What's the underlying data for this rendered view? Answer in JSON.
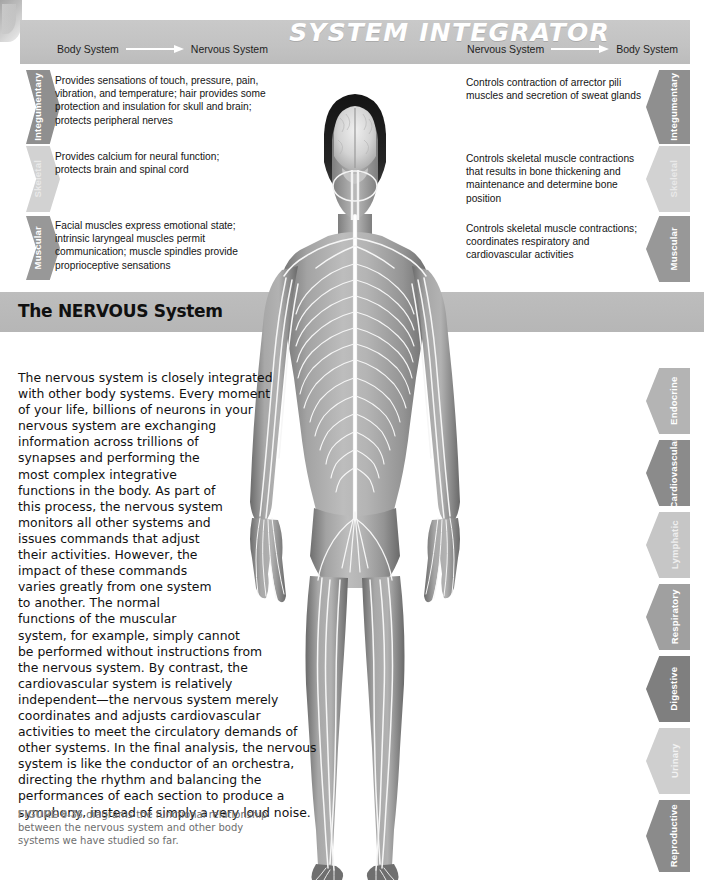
{
  "header": {
    "title": "SYSTEM INTEGRATOR",
    "flow_left": {
      "from": "Body System",
      "to": "Nervous System"
    },
    "flow_right": {
      "from": "Nervous System",
      "to": "Body System"
    }
  },
  "banner": {
    "title": "The NERVOUS System"
  },
  "left_column": [
    {
      "system": "Integumentary",
      "text": "Provides sensations of touch, pressure, pain, vibration, and temperature; hair provides some protection and insulation for skull and brain; protects peripheral nerves",
      "color": "#8f8f8f"
    },
    {
      "system": "Skeletal",
      "text": "Provides calcium for neural function; protects brain and spinal cord",
      "color": "#d2d2d2"
    },
    {
      "system": "Muscular",
      "text": "Facial muscles express emotional state; intrinsic laryngeal muscles permit communication; muscle spindles provide proprioceptive sensations",
      "color": "#989898"
    }
  ],
  "right_column": [
    {
      "system": "Integumentary",
      "text": "Controls contraction of arrector pili muscles and secretion of sweat glands",
      "color": "#8f8f8f"
    },
    {
      "system": "Skeletal",
      "text": "Controls skeletal muscle contractions that results in bone thickening and maintenance and determine bone position",
      "color": "#d2d2d2"
    },
    {
      "system": "Muscular",
      "text": "Controls skeletal muscle contractions; coordinates respiratory and  cardiovascular activities",
      "color": "#989898"
    }
  ],
  "system_tabs": [
    {
      "system": "Endocrine",
      "color": "#b4b4b4"
    },
    {
      "system": "Cardiovascular",
      "color": "#8b8b8b"
    },
    {
      "system": "Lymphatic",
      "color": "#c6c6c6"
    },
    {
      "system": "Respiratory",
      "color": "#a0a0a0"
    },
    {
      "system": "Digestive",
      "color": "#7f7f7f"
    },
    {
      "system": "Urinary",
      "color": "#cfcfcf"
    },
    {
      "system": "Reproductive",
      "color": "#8b8b8b"
    }
  ],
  "body_copy_lines": [
    "The nervous system is closely integrated",
    "with other body systems.  Every moment",
    "of your life, billions of neurons in your",
    "nervous system are exchanging",
    "information across trillions of",
    "synapses and performing the",
    "most complex integrative",
    "functions in the body. As part of",
    "this process, the nervous system",
    "monitors all other systems and",
    "issues commands that adjust",
    "their activities. However, the",
    "impact of these commands",
    "varies greatly from one system",
    "to another. The normal",
    "functions of the muscular",
    "system, for example, simply cannot",
    "be performed without instructions from",
    "the nervous system. By contrast, the",
    "cardiovascular system is relatively",
    "independent—the nervous system merely",
    "coordinates and adjusts cardiovascular",
    "activities to meet the circulatory demands of",
    "other systems. In the final analysis, the nervous",
    "system is like the conductor of an orchestra,",
    "directing the rhythm and balancing the",
    "performances of each section to produce a",
    "symphony, instead of simply a very loud noise."
  ],
  "caption": {
    "figure_number": "FIGURE 8-36",
    "text": " diagrams the functional relationship between the nervous system and other body systems we have studied so far."
  },
  "figure": {
    "alt": "anterior view of human body showing the nervous system: brain, spinal cord and peripheral nerves in white over gray anatomy"
  }
}
